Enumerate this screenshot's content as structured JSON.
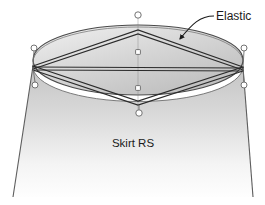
{
  "canvas": {
    "width": 265,
    "height": 205,
    "background": "#ffffff"
  },
  "figure": {
    "type": "technical-line-illustration"
  },
  "labels": {
    "elastic": {
      "text": "Elastic",
      "x": 216,
      "y": 20,
      "anchor": "start"
    },
    "skirt": {
      "text": "Skirt RS",
      "x": 133,
      "y": 147,
      "anchor": "middle"
    }
  },
  "leader": {
    "path": "M 214 16 C 200 16 192 24 180 38",
    "arrow_tip_x": 178,
    "arrow_tip_y": 41,
    "color": "#1b1b1b"
  },
  "geometry": {
    "ellipse": {
      "cx": 138,
      "cy": 60,
      "rx": 105,
      "ry": 35,
      "top_y": 25,
      "bottom_y": 95
    },
    "vertex_left": {
      "x": 33,
      "y": 66
    },
    "vertex_right": {
      "x": 243,
      "y": 67
    },
    "apex_top": {
      "x": 138,
      "y": 30
    },
    "apex_bottom": {
      "x": 138,
      "y": 105
    },
    "rod": {
      "x": 138,
      "top_y": 18,
      "bottom_y": 110
    },
    "skirt": {
      "left_top_x": 33,
      "left_bottom_x": 13,
      "right_top_x": 243,
      "right_bottom_x": 253,
      "bottom_y": 197
    }
  },
  "grommets": [
    {
      "name": "grommet-rod-top",
      "x": 138,
      "y": 15,
      "r": 3.2
    },
    {
      "name": "grommet-rod-mid",
      "x": 138,
      "y": 52,
      "r": 2.6
    },
    {
      "name": "grommet-rod-lower",
      "x": 138,
      "y": 88,
      "r": 2.6
    },
    {
      "name": "grommet-apex-bottom",
      "x": 139,
      "y": 113,
      "r": 3.2
    },
    {
      "name": "grommet-left-upper",
      "x": 34,
      "y": 48,
      "r": 3.0
    },
    {
      "name": "grommet-left-lower",
      "x": 35,
      "y": 85,
      "r": 3.0
    },
    {
      "name": "grommet-right-upper",
      "x": 244,
      "y": 48,
      "r": 3.0
    },
    {
      "name": "grommet-right-lower",
      "x": 244,
      "y": 85,
      "r": 3.0
    }
  ],
  "colors": {
    "outline": "#4a4a4a",
    "cord": "#2b2b2b",
    "rod": "#8f8f8f",
    "ellipse_fill_light": "#e4e4e4",
    "ellipse_fill_dark": "#b9b9b9",
    "skirt_fill_top": "#c9c9c9",
    "skirt_fill_bottom": "#fdfdfd",
    "ring_stroke": "#6b6b6b",
    "ring_fill": "#ffffff",
    "text": "#1b1b1b"
  }
}
